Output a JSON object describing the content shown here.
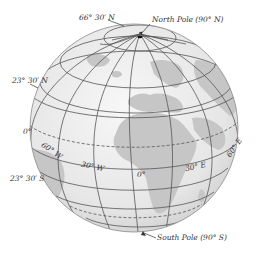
{
  "figure": {
    "type": "globe-diagram",
    "colors": {
      "ocean": "#ececec",
      "land": "#c9c9c9",
      "grid": "#555555",
      "outline": "#8a8a8a",
      "text": "#333333"
    }
  },
  "labels": {
    "arctic_circle": "66° 30′ N",
    "north_pole": "North Pole (90° N)",
    "tropic_cancer": "23° 30′ N",
    "equator": "0°",
    "tropic_capricorn": "23° 30′ S",
    "south_pole": "South Pole (90° S)",
    "lon_60w": "60° W",
    "lon_30w": "30° W",
    "lon_0": "0°",
    "lon_30e": "30° E",
    "lon_60e": "60° E"
  }
}
